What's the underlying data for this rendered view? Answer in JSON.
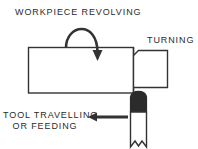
{
  "diagram": {
    "type": "machining-process-diagram",
    "colors": {
      "background": "#ffffff",
      "outline": "#333333",
      "text": "#2b2b2b",
      "tool_tip_fill": "#2b2b2b",
      "tool_shank_fill": "#ffffff",
      "arrow": "#333333"
    },
    "labels": {
      "workpiece_revolving": "WORKPIECE REVOLVING",
      "turning": "TURNING",
      "tool_travelling": "TOOL TRAVELLING",
      "or_feeding": "OR FEEDING"
    },
    "parts": {
      "workpiece_large_diameter": "workpiece-body",
      "workpiece_turned_step": "workpiece-turned-section",
      "cutting_tool": "cutting-tool",
      "tool_cutting_tip": "tool-cutting-tip",
      "tool_shank": "tool-shank"
    },
    "arrows": {
      "rotation": "curved rotation arrow pointing down over workpiece",
      "feed": "straight arrow pointing left toward tool travel direction"
    }
  }
}
